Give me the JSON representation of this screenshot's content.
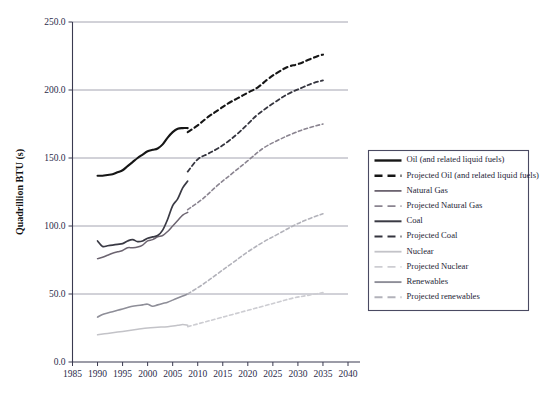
{
  "chart_data": {
    "type": "line",
    "title": "",
    "xlabel": "",
    "ylabel": "Quadrillion BTU (s)",
    "xlim": [
      1985,
      2040
    ],
    "ylim": [
      0,
      250
    ],
    "xticks": [
      "1985",
      "1990",
      "1995",
      "2000",
      "2005",
      "2010",
      "2015",
      "2020",
      "2025",
      "2030",
      "2035",
      "2040"
    ],
    "yticks": [
      "0.0",
      "50.0",
      "100.0",
      "150.0",
      "200.0",
      "250.0"
    ],
    "grid": "horizontal",
    "legend_position": "right",
    "series": [
      {
        "name": "Oil (and related liquid fuels)",
        "style": "solid",
        "color": "#161616",
        "width": 2.1,
        "x": [
          1990,
          1991,
          1992,
          1993,
          1994,
          1995,
          1996,
          1997,
          1998,
          1999,
          2000,
          2001,
          2002,
          2003,
          2004,
          2005,
          2006,
          2007,
          2008
        ],
        "values": [
          137,
          137,
          137.5,
          138,
          139.5,
          141,
          144,
          147,
          150,
          152.5,
          155,
          156,
          157,
          160,
          165,
          169,
          171.5,
          172,
          172
        ]
      },
      {
        "name": "Projected Oil (and related liquid fuels)",
        "style": "dashed",
        "color": "#161616",
        "width": 2.1,
        "x": [
          2008,
          2010,
          2012,
          2014,
          2016,
          2018,
          2020,
          2022,
          2024,
          2026,
          2028,
          2030,
          2032,
          2034,
          2035
        ],
        "values": [
          169,
          174,
          180,
          185,
          190,
          194,
          198,
          202,
          208,
          213,
          217,
          219,
          222,
          225,
          226
        ]
      },
      {
        "name": "Natural Gas",
        "style": "solid",
        "color": "#6c6470",
        "width": 1.5,
        "x": [
          1990,
          1991,
          1992,
          1993,
          1994,
          1995,
          1996,
          1997,
          1998,
          1999,
          2000,
          2001,
          2002,
          2003,
          2004,
          2005,
          2006,
          2007,
          2008
        ],
        "values": [
          76,
          77,
          78.5,
          80,
          81,
          82,
          84,
          84,
          84.5,
          86,
          89,
          90,
          92,
          93,
          96,
          100,
          104,
          108,
          110
        ]
      },
      {
        "name": "Projected Natural Gas",
        "style": "dashed",
        "color": "#8a8490",
        "width": 1.6,
        "x": [
          2008,
          2011,
          2014,
          2017,
          2020,
          2023,
          2026,
          2029,
          2032,
          2035
        ],
        "values": [
          112,
          120,
          130,
          139,
          148,
          157,
          163,
          168,
          172,
          175
        ]
      },
      {
        "name": "Coal",
        "style": "solid",
        "color": "#3a3a44",
        "width": 1.7,
        "x": [
          1990,
          1991,
          1992,
          1993,
          1994,
          1995,
          1996,
          1997,
          1998,
          1999,
          2000,
          2001,
          2002,
          2003,
          2004,
          2005,
          2006,
          2007,
          2008
        ],
        "values": [
          89,
          85,
          85.5,
          86,
          86.5,
          87,
          89,
          90,
          88.5,
          89,
          91,
          92,
          93,
          97,
          105,
          115,
          120,
          128,
          133
        ]
      },
      {
        "name": "Projected Coal",
        "style": "dashed",
        "color": "#35353f",
        "width": 1.8,
        "x": [
          2008,
          2010,
          2012,
          2014,
          2016,
          2018,
          2020,
          2022,
          2025,
          2028,
          2031,
          2033,
          2035
        ],
        "values": [
          140,
          149,
          153,
          157,
          162,
          168,
          175,
          182,
          190,
          197,
          202,
          205,
          207
        ]
      },
      {
        "name": "Nuclear",
        "style": "solid",
        "color": "#c3c3c8",
        "width": 1.5,
        "x": [
          1990,
          1992,
          1994,
          1996,
          1998,
          2000,
          2002,
          2004,
          2006,
          2007,
          2008
        ],
        "values": [
          20,
          21,
          22,
          23,
          24,
          25,
          25.5,
          26,
          27,
          27.5,
          27
        ]
      },
      {
        "name": "Projected Nuclear",
        "style": "dashed",
        "color": "#cdcdd2",
        "width": 1.6,
        "x": [
          2008,
          2011,
          2014,
          2017,
          2020,
          2023,
          2026,
          2029,
          2032,
          2035
        ],
        "values": [
          26,
          29,
          32,
          35,
          38,
          41,
          44,
          47,
          49,
          51
        ]
      },
      {
        "name": "Renewables",
        "style": "solid",
        "color": "#8e8e98",
        "width": 1.6,
        "x": [
          1990,
          1991,
          1992,
          1993,
          1994,
          1995,
          1996,
          1997,
          1998,
          1999,
          2000,
          2001,
          2002,
          2003,
          2004,
          2005,
          2006,
          2007,
          2008
        ],
        "values": [
          33,
          35,
          36,
          37,
          38,
          39,
          40,
          41,
          41.5,
          42,
          42.5,
          41,
          42,
          43,
          44,
          45.5,
          47,
          48.5,
          50
        ]
      },
      {
        "name": "Projected renewables",
        "style": "dashed",
        "color": "#b2b2ba",
        "width": 1.6,
        "x": [
          2008,
          2011,
          2014,
          2017,
          2020,
          2023,
          2026,
          2029,
          2032,
          2035
        ],
        "values": [
          50,
          57,
          65,
          73,
          81,
          88,
          94,
          100,
          105,
          109
        ]
      }
    ]
  },
  "legend": {
    "items": [
      {
        "label": "Oil (and related liquid fuels)"
      },
      {
        "label": "Projected Oil (and related liquid fuels)"
      },
      {
        "label": "Natural Gas"
      },
      {
        "label": "Projected Natural Gas"
      },
      {
        "label": "Coal"
      },
      {
        "label": "Projected Coal"
      },
      {
        "label": "Nuclear"
      },
      {
        "label": "Projected Nuclear"
      },
      {
        "label": "Renewables"
      },
      {
        "label": "Projected renewables"
      }
    ]
  }
}
